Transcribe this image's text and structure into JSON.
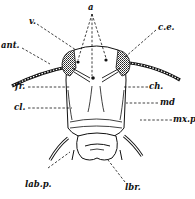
{
  "figure": {
    "ink_color": "#111111",
    "background": "#ffffff"
  },
  "labels": {
    "a": "a",
    "v": "v.",
    "ce": "c.e.",
    "ant": "ant.",
    "fr": "fr.",
    "ch": "ch.",
    "cl": "cl.",
    "md": "md",
    "mxp": "mx.p.",
    "labp": "lab.p.",
    "lbr": "lbr."
  }
}
